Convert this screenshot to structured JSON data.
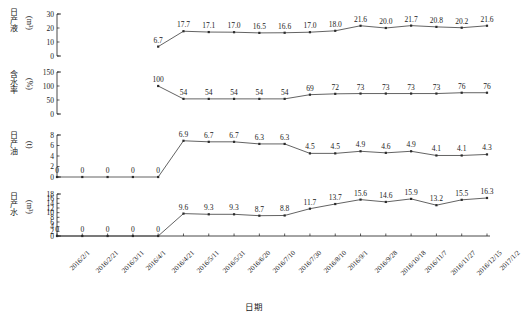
{
  "chart_data": {
    "type": "line",
    "title": "",
    "xlabel": "日期",
    "grid": false,
    "legend": "none",
    "x": [
      "2016/2/1",
      "2016/2/21",
      "2016/3/11",
      "2016/4/1",
      "2016/4/21",
      "2016/5/11",
      "2016/5/31",
      "2016/6/20",
      "2016/7/10",
      "2016/7/30",
      "2016/8/10",
      "2016/9/1",
      "2016/9/28",
      "2016/10/18",
      "2016/11/7",
      "2016/11/27",
      "2016/12/15",
      "2017/1/2"
    ],
    "panels": [
      {
        "name": "daily-liquid-production",
        "ylabel": "日产液",
        "yunit": "(m³)",
        "ylim": [
          0,
          30
        ],
        "yticks": [
          0,
          10,
          20,
          30
        ],
        "start_index": 4,
        "values": [
          6.7,
          17.7,
          17.1,
          17.0,
          16.5,
          16.6,
          17.0,
          18.0,
          21.6,
          20.0,
          21.7,
          20.8,
          20.2,
          21.6
        ],
        "point_labels": [
          "6.7",
          "17.7",
          "17.1",
          "17.0",
          "16.5",
          "16.6",
          "17.0",
          "18.0",
          "21.6",
          "20.0",
          "21.7",
          "20.8",
          "20.2",
          "21.6"
        ]
      },
      {
        "name": "water-cut",
        "ylabel": "含水率",
        "yunit": "(%)",
        "ylim": [
          0,
          150
        ],
        "yticks": [
          0,
          50,
          100,
          150
        ],
        "start_index": 4,
        "values": [
          100,
          54,
          54,
          54,
          54,
          54,
          69,
          72,
          73,
          73,
          73,
          73,
          76,
          76
        ],
        "point_labels": [
          "100",
          "54",
          "54",
          "54",
          "54",
          "54",
          "69",
          "72",
          "73",
          "73",
          "73",
          "73",
          "76",
          "76"
        ]
      },
      {
        "name": "daily-oil-production",
        "ylabel": "日产油",
        "yunit": "(t)",
        "ylim": [
          0,
          8
        ],
        "yticks": [
          0,
          2,
          4,
          6,
          8
        ],
        "start_index": 0,
        "values": [
          0,
          0,
          0,
          0,
          0,
          6.9,
          6.7,
          6.7,
          6.3,
          6.3,
          4.5,
          4.5,
          4.9,
          4.6,
          4.9,
          4.1,
          4.1,
          4.3
        ],
        "point_labels": [
          "0",
          "0",
          "0",
          "0",
          "0",
          "6.9",
          "6.7",
          "6.7",
          "6.3",
          "6.3",
          "4.5",
          "4.5",
          "4.9",
          "4.6",
          "4.9",
          "4.1",
          "4.1",
          "4.3"
        ]
      },
      {
        "name": "daily-water-production",
        "ylabel": "日产水",
        "yunit": "(m³)",
        "ylim": [
          0,
          18
        ],
        "yticks": [
          0,
          2,
          4,
          6,
          8,
          10,
          12,
          14,
          16,
          18
        ],
        "start_index": 0,
        "values": [
          0,
          0,
          0,
          0,
          0,
          9.6,
          9.3,
          9.3,
          8.7,
          8.8,
          11.7,
          13.7,
          15.6,
          14.6,
          15.9,
          13.2,
          15.5,
          16.3
        ],
        "point_labels": [
          "0",
          "0",
          "0",
          "0",
          "0",
          "9.6",
          "9.3",
          "9.3",
          "8.7",
          "8.8",
          "11.7",
          "13.7",
          "15.6",
          "14.6",
          "15.9",
          "13.2",
          "15.5",
          "16.3"
        ]
      }
    ]
  }
}
